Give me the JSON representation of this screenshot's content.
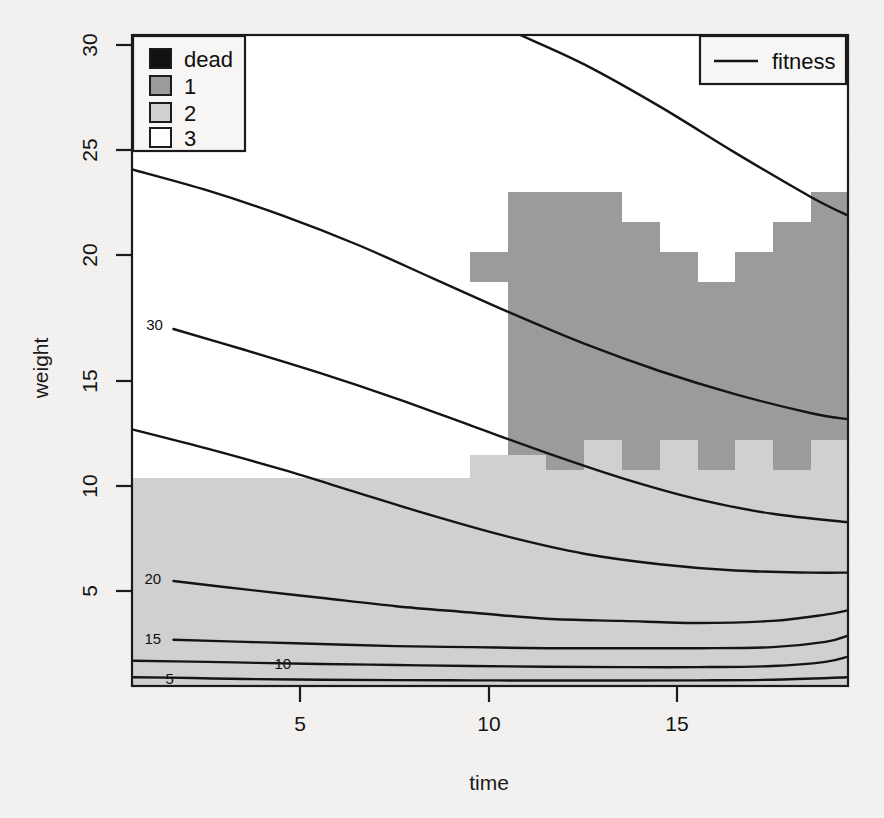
{
  "figure": {
    "type": "contour-over-image",
    "background_color": "#f2f1ef"
  },
  "chart_data": {
    "type": "line",
    "title": "",
    "subtitle": "",
    "xlabel": "time",
    "ylabel": "weight",
    "xlim": [
      1,
      20
    ],
    "ylim": [
      0,
      31
    ],
    "xticks": [
      5,
      10,
      15
    ],
    "yticks": [
      5,
      10,
      15,
      20,
      25,
      30
    ],
    "grid": false,
    "legends": [
      {
        "name": "state-legend",
        "position": "top-left",
        "entries": [
          {
            "label": "dead",
            "color": "#111111",
            "swatch": "filled-square"
          },
          {
            "label": "1",
            "color": "#9b9b9b",
            "swatch": "filled-square"
          },
          {
            "label": "2",
            "color": "#d0d0d0",
            "swatch": "filled-square"
          },
          {
            "label": "3",
            "color": "#ffffff",
            "swatch": "filled-square"
          }
        ]
      },
      {
        "name": "fitness-legend",
        "position": "top-right",
        "entries": [
          {
            "label": "fitness",
            "color": "#141414",
            "swatch": "line"
          }
        ]
      }
    ],
    "contours": [
      {
        "level": 30,
        "label": "30",
        "label_x": 1.6,
        "label_y": 17.2,
        "points": [
          [
            2.1,
            17.0
          ],
          [
            4,
            16.0
          ],
          [
            6,
            14.9
          ],
          [
            8,
            13.7
          ],
          [
            10,
            12.4
          ],
          [
            12,
            11.1
          ],
          [
            14,
            9.9
          ],
          [
            16,
            8.9
          ],
          [
            18,
            8.2
          ],
          [
            20,
            7.8
          ]
        ]
      },
      {
        "level": 25,
        "label": "",
        "points": [
          [
            1.0,
            24.6
          ],
          [
            3,
            23.6
          ],
          [
            5,
            22.4
          ],
          [
            7,
            21.0
          ],
          [
            9,
            19.4
          ],
          [
            11,
            17.8
          ],
          [
            13,
            16.3
          ],
          [
            15,
            15.0
          ],
          [
            17,
            13.9
          ],
          [
            19,
            13.0
          ],
          [
            20,
            12.7
          ]
        ]
      },
      {
        "level": 35,
        "label": "",
        "points": [
          [
            1.05,
            12.2
          ],
          [
            3,
            11.3
          ],
          [
            5,
            10.3
          ],
          [
            7,
            9.2
          ],
          [
            9,
            8.1
          ],
          [
            11,
            7.1
          ],
          [
            13,
            6.3
          ],
          [
            15,
            5.8
          ],
          [
            17,
            5.5
          ],
          [
            19,
            5.4
          ],
          [
            20,
            5.4
          ]
        ]
      },
      {
        "level": 20,
        "label": "20",
        "label_x": 1.55,
        "label_y": 5.1,
        "points": [
          [
            2.1,
            5.0
          ],
          [
            4,
            4.6
          ],
          [
            6,
            4.2
          ],
          [
            8,
            3.8
          ],
          [
            10,
            3.5
          ],
          [
            12,
            3.2
          ],
          [
            14,
            3.1
          ],
          [
            16,
            3.0
          ],
          [
            18,
            3.1
          ],
          [
            19.4,
            3.4
          ],
          [
            20,
            3.6
          ]
        ]
      },
      {
        "level": 15,
        "label": "15",
        "label_x": 1.55,
        "label_y": 2.25,
        "points": [
          [
            2.1,
            2.2
          ],
          [
            4,
            2.1
          ],
          [
            6,
            2.0
          ],
          [
            8,
            1.9
          ],
          [
            10,
            1.85
          ],
          [
            12,
            1.8
          ],
          [
            14,
            1.8
          ],
          [
            16,
            1.8
          ],
          [
            18,
            1.85
          ],
          [
            19.4,
            2.1
          ],
          [
            20,
            2.4
          ]
        ]
      },
      {
        "level": 10,
        "label": "10",
        "label_x": 5.0,
        "label_y": 1.05,
        "points": [
          [
            1.05,
            1.2
          ],
          [
            3,
            1.15
          ],
          [
            4.3,
            1.1
          ],
          [
            6.0,
            1.05
          ],
          [
            8,
            1.0
          ],
          [
            10,
            0.95
          ],
          [
            12,
            0.92
          ],
          [
            14,
            0.9
          ],
          [
            16,
            0.9
          ],
          [
            18,
            0.95
          ],
          [
            19.4,
            1.15
          ],
          [
            20,
            1.4
          ]
        ]
      },
      {
        "level": 5,
        "label": "5",
        "label_x": 2.0,
        "label_y": 0.35,
        "points": [
          [
            1.05,
            0.42
          ],
          [
            2.6,
            0.38
          ],
          [
            4,
            0.33
          ],
          [
            6,
            0.3
          ],
          [
            8,
            0.28
          ],
          [
            10,
            0.27
          ],
          [
            12,
            0.26
          ],
          [
            14,
            0.26
          ],
          [
            16,
            0.27
          ],
          [
            18,
            0.3
          ],
          [
            20,
            0.42
          ]
        ]
      },
      {
        "level": 40,
        "label": "",
        "points": [
          [
            11.3,
            31.0
          ],
          [
            13,
            29.6
          ],
          [
            15,
            27.6
          ],
          [
            17,
            25.4
          ],
          [
            19,
            23.3
          ],
          [
            20,
            22.4
          ]
        ]
      }
    ],
    "state_regions": [
      {
        "state": "3",
        "color": "#ffffff",
        "description": "upper/left white region"
      },
      {
        "state": "2",
        "color": "#d0d0d0",
        "description": "light gray band below weight~10.4 and stepped wedge mid-right"
      },
      {
        "state": "1",
        "color": "#9b9b9b",
        "description": "dark gray stepped wedge in upper right"
      }
    ]
  }
}
